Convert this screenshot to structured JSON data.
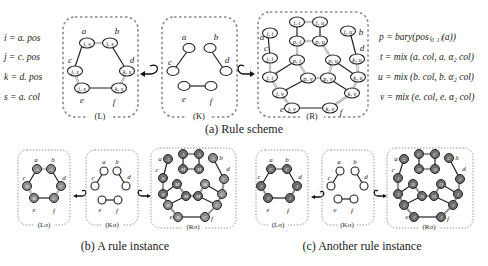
{
  "figure": {
    "scheme": {
      "caption": "(a) Rule scheme",
      "definitions": [
        "i = a. pos",
        "j = c. pos",
        "k = d. pos",
        "s = a. col"
      ],
      "equations": [
        "p = bary(pos₍₀ ₁₎(a))",
        "t = mix (a. col, a. α₂ col)",
        "u = mix (b. col, b. α₂ col)",
        "v = mix (e. col, e. α₂ col)"
      ],
      "L": {
        "label": "(L)",
        "nodes": [
          {
            "name": "a",
            "text": "i, s"
          },
          {
            "name": "b",
            "text": "i, s"
          },
          {
            "name": "c",
            "text": "j, s"
          },
          {
            "name": "d",
            "text": "k, s"
          },
          {
            "name": "e",
            "text": "j, s"
          },
          {
            "name": "f",
            "text": "k, s"
          }
        ]
      },
      "K": {
        "label": "(K)",
        "nodes": [
          "a",
          "b",
          "c",
          "d",
          "e",
          "f"
        ]
      },
      "R": {
        "label": "(R)",
        "node_texts": [
          "i, t",
          "i, t",
          "i, u",
          "i, u",
          "j, t",
          "k, u",
          "p, t",
          "p, u",
          "p, t",
          "p, u",
          "j, t",
          "k, u",
          "p, v",
          "p, v",
          "j, v",
          "k, v",
          "j, v",
          "k, v"
        ],
        "vertex_labels": [
          "a",
          "b",
          "c",
          "d",
          "e",
          "f"
        ]
      }
    },
    "instance_b": {
      "caption": "(b) A rule instance",
      "L_label": "(Lσ)",
      "K_label": "(Kσ)",
      "R_label": "(Rσ)",
      "L_node_letters": [
        "A",
        "A",
        "B",
        "C",
        "B",
        "C"
      ],
      "R_node_letters": [
        "A",
        "A",
        "A",
        "A",
        "B",
        "C",
        "M",
        "M",
        "M",
        "M",
        "B",
        "C",
        "M",
        "M",
        "B",
        "C",
        "B",
        "C"
      ]
    },
    "instance_c": {
      "caption": "(c) Another rule instance",
      "L_label": "(Lσ)",
      "K_label": "(Kσ)",
      "R_label": "(Rσ)",
      "L_node_letters": [
        "C",
        "C",
        "J",
        "J",
        "J",
        "J"
      ],
      "R_node_letters": [
        "C",
        "C",
        "C",
        "C",
        "J",
        "J",
        "O",
        "O",
        "O",
        "O",
        "J",
        "J",
        "O",
        "O",
        "J",
        "J",
        "J",
        "J"
      ]
    },
    "vertex_names": [
      "a",
      "b",
      "c",
      "d",
      "e",
      "f"
    ]
  }
}
